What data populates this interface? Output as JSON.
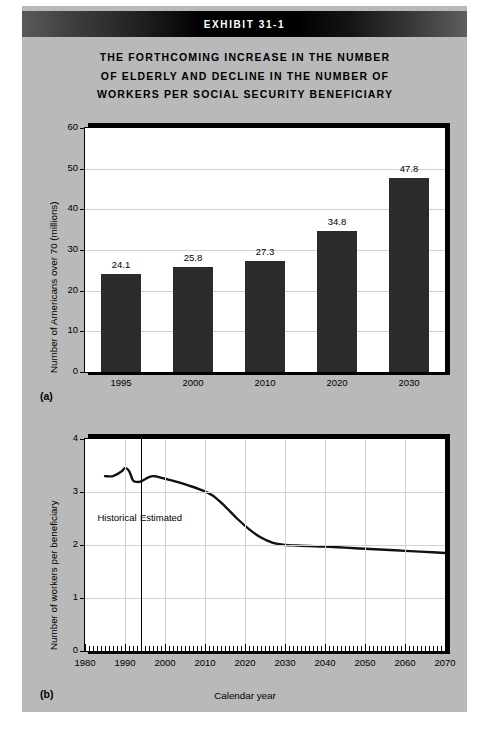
{
  "exhibit": {
    "banner_label": "EXHIBIT 31-1",
    "title_lines": [
      "THE FORTHCOMING INCREASE IN THE NUMBER",
      "OF ELDERLY AND DECLINE IN THE NUMBER OF",
      "WORKERS PER SOCIAL SECURITY BENEFICIARY"
    ],
    "panel_a_letter": "(a)",
    "panel_b_letter": "(b)"
  },
  "colors": {
    "page_background": "#b9b9b9",
    "bar_fill": "#2b2b2b",
    "axis": "#000000",
    "gridline": "#d2d2d2",
    "banner_text": "#ffffff",
    "plot_background": "#ffffff"
  },
  "chart_data": [
    {
      "type": "bar",
      "panel": "(a)",
      "title": "",
      "xlabel": "",
      "ylabel": "Number of Americans over 70 (millions)",
      "categories": [
        "1995",
        "2000",
        "2010",
        "2020",
        "2030"
      ],
      "values": [
        24.1,
        25.8,
        27.3,
        34.8,
        47.8
      ],
      "data_labels": [
        "24.1",
        "25.8",
        "27.3",
        "34.8",
        "47.8"
      ],
      "ylim": [
        0,
        60
      ],
      "yticks": [
        0,
        10,
        20,
        30,
        40,
        50,
        60
      ],
      "ytick_labels": [
        "0",
        "10",
        "20",
        "30",
        "40",
        "50",
        "60"
      ],
      "grid": true,
      "legend": "none"
    },
    {
      "type": "line",
      "panel": "(b)",
      "title": "",
      "xlabel": "Calendar year",
      "ylabel": "Number of workers per beneficiary",
      "xlim": [
        1980,
        2070
      ],
      "ylim": [
        0,
        4
      ],
      "yticks": [
        0,
        1,
        2,
        3,
        4
      ],
      "ytick_labels": [
        "0",
        "1",
        "2",
        "3",
        "4"
      ],
      "xticks": [
        1980,
        1990,
        2000,
        2010,
        2020,
        2030,
        2040,
        2050,
        2060,
        2070
      ],
      "xtick_labels": [
        "1980",
        "1990",
        "2000",
        "2010",
        "2020",
        "2030",
        "2040",
        "2050",
        "2060",
        "2070"
      ],
      "grid": true,
      "minor_tick_interval": 1,
      "annotations": [
        {
          "text": "Historical",
          "x": 1988,
          "y": 2.5
        },
        {
          "text": "Estimated",
          "x": 1999,
          "y": 2.5
        }
      ],
      "divider_year": 1994,
      "series": [
        {
          "name": "Workers per beneficiary",
          "x": [
            1985,
            1987,
            1989,
            1990,
            1991,
            1992,
            1993,
            1994,
            1995,
            1996,
            1997,
            1998,
            2000,
            2003,
            2006,
            2009,
            2012,
            2015,
            2018,
            2021,
            2024,
            2027,
            2030,
            2033,
            2036,
            2040,
            2045,
            2050,
            2055,
            2060,
            2065,
            2070
          ],
          "values": [
            3.3,
            3.3,
            3.38,
            3.45,
            3.4,
            3.22,
            3.19,
            3.2,
            3.24,
            3.28,
            3.3,
            3.29,
            3.25,
            3.19,
            3.12,
            3.04,
            2.93,
            2.73,
            2.5,
            2.3,
            2.14,
            2.04,
            2.0,
            1.99,
            1.98,
            1.97,
            1.95,
            1.93,
            1.91,
            1.89,
            1.87,
            1.85
          ]
        }
      ]
    }
  ]
}
